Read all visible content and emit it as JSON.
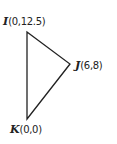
{
  "diagram": {
    "type": "triangle",
    "stroke_color": "#222222",
    "background": "#ffffff",
    "vertices": [
      {
        "name": "I",
        "coords": "(0,12.5)",
        "x": 0,
        "y": 12.5
      },
      {
        "name": "J",
        "coords": "(6,8)",
        "x": 6,
        "y": 8
      },
      {
        "name": "K",
        "coords": "(0,0)",
        "x": 0,
        "y": 0
      }
    ],
    "edges": [
      {
        "from": "I",
        "to": "J"
      },
      {
        "from": "J",
        "to": "K"
      },
      {
        "from": "K",
        "to": "I"
      }
    ]
  }
}
